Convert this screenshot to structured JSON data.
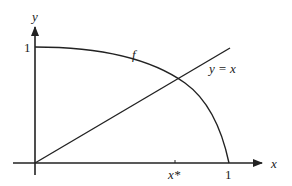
{
  "diagram": {
    "axes": {
      "x_label": "x",
      "y_label": "y",
      "y_tick_label": "1",
      "x_tick_label": "1",
      "x_star_label": "x*"
    },
    "curves": [
      {
        "name": "f",
        "label": "f",
        "description": "decreasing concave curve from (0,1) to (1,0)"
      },
      {
        "name": "identity",
        "label": "y = x",
        "description": "straight line through origin"
      }
    ],
    "colors": {
      "stroke": "#222222",
      "background": "#ffffff"
    }
  }
}
